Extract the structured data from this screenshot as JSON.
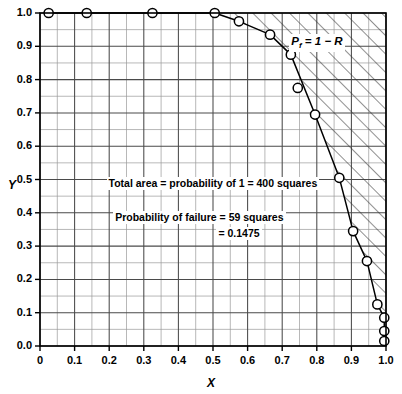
{
  "chart_data": {
    "type": "scatter",
    "title": "",
    "xlabel": "X",
    "ylabel": "Y",
    "xlim": [
      0.0,
      1.0
    ],
    "ylim": [
      0.0,
      1.0
    ],
    "grid": true,
    "grid_step": 0.05,
    "grid_squares_total": 400,
    "legend_position": "none",
    "xticks": [
      "0",
      "0.1",
      "0.2",
      "0.3",
      "0.4",
      "0.5",
      "0.6",
      "0.7",
      "0.8",
      "0.9",
      "1.0"
    ],
    "xtick_values": [
      0.0,
      0.1,
      0.2,
      0.3,
      0.4,
      0.5,
      0.6,
      0.7,
      0.8,
      0.9,
      1.0
    ],
    "yticks": [
      "0.0",
      "0.1",
      "0.2",
      "0.3",
      "0.4",
      "0.5",
      "0.6",
      "0.7",
      "0.8",
      "0.9",
      "1.0"
    ],
    "ytick_values": [
      0.0,
      0.1,
      0.2,
      0.3,
      0.4,
      0.5,
      0.6,
      0.7,
      0.8,
      0.9,
      1.0
    ],
    "series": [
      {
        "name": "limit-state-boundary",
        "marker": "open-circle",
        "line": "solid",
        "points": [
          {
            "x": 0.025,
            "y": 1.0
          },
          {
            "x": 0.135,
            "y": 1.0
          },
          {
            "x": 0.325,
            "y": 1.0
          },
          {
            "x": 0.505,
            "y": 1.0
          },
          {
            "x": 0.575,
            "y": 0.975
          },
          {
            "x": 0.665,
            "y": 0.935
          },
          {
            "x": 0.725,
            "y": 0.875
          },
          {
            "x": 0.795,
            "y": 0.695
          },
          {
            "x": 0.865,
            "y": 0.505
          },
          {
            "x": 0.905,
            "y": 0.345
          },
          {
            "x": 0.945,
            "y": 0.255
          },
          {
            "x": 0.975,
            "y": 0.125
          },
          {
            "x": 0.995,
            "y": 0.085
          },
          {
            "x": 0.995,
            "y": 0.045
          },
          {
            "x": 0.995,
            "y": 0.015
          }
        ]
      },
      {
        "name": "isolated-sample-point",
        "marker": "open-circle",
        "line": "none",
        "points": [
          {
            "x": 0.745,
            "y": 0.775
          }
        ]
      }
    ],
    "shaded_region": {
      "name": "failure-region",
      "pattern": "diagonal-hatch",
      "description": "region to the right of / above the limit-state curve"
    },
    "annotations": [
      {
        "name": "total-area-note",
        "text": "Total area = probability of 1 = 400 squares",
        "x": 0.5,
        "y": 0.485
      },
      {
        "name": "probability-of-failure-note-line1",
        "text": "Probability of failure = 59 squares",
        "x": 0.46,
        "y": 0.385
      },
      {
        "name": "probability-of-failure-note-line2",
        "text": "= 0.1475",
        "x": 0.575,
        "y": 0.335
      },
      {
        "name": "failure-probability-label",
        "text_html": "P<sub>f</sub> = 1 − R",
        "text": "Pf = 1 − R",
        "x": 0.8,
        "y": 0.915
      }
    ],
    "colors": {
      "axis": "#000000",
      "grid_major": "#4d4d4d",
      "grid_minor": "#999999",
      "curve": "#000000",
      "marker_fill": "#ffffff",
      "hatch": "#333333",
      "background": "#ffffff"
    }
  }
}
